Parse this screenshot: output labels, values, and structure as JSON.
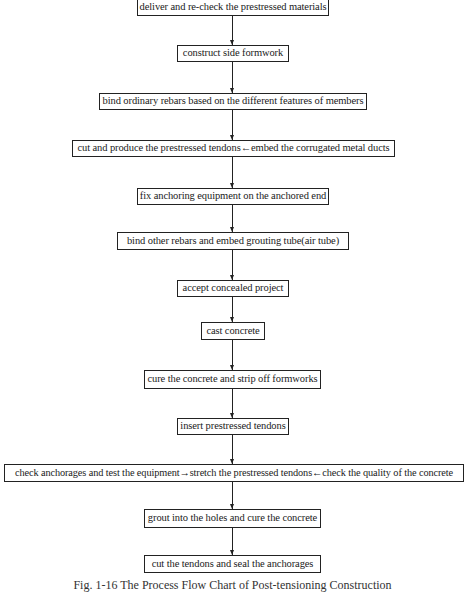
{
  "flowchart": {
    "steps": [
      {
        "id": 1,
        "label": "deliver and re-check the prestressed materials"
      },
      {
        "id": 2,
        "label": "construct side formwork"
      },
      {
        "id": 3,
        "label": "bind ordinary rebars based on the different features of members"
      },
      {
        "id": 4,
        "label": "cut and produce the prestressed tendons←embed the corrugated metal ducts"
      },
      {
        "id": 5,
        "label": "fix anchoring equipment on the anchored end"
      },
      {
        "id": 6,
        "label": "bind other rebars and embed grouting tube(air tube)"
      },
      {
        "id": 7,
        "label": "accept concealed project"
      },
      {
        "id": 8,
        "label": "cast concrete"
      },
      {
        "id": 9,
        "label": "cure the concrete and strip off formworks"
      },
      {
        "id": 10,
        "label": "insert prestressed tendons"
      },
      {
        "id": 11,
        "label": "check anchorages and test the equipment→stretch the prestressed tendons←check the quality of the concrete"
      },
      {
        "id": 12,
        "label": "grout into the holes and cure the concrete"
      },
      {
        "id": 13,
        "label": "cut the tendons and seal the anchorages"
      }
    ],
    "connections": [
      {
        "from": 1,
        "to": 2
      },
      {
        "from": 2,
        "to": 3
      },
      {
        "from": 3,
        "to": 4
      },
      {
        "from": 4,
        "to": 5
      },
      {
        "from": 5,
        "to": 6
      },
      {
        "from": 6,
        "to": 7
      },
      {
        "from": 7,
        "to": 8
      },
      {
        "from": 8,
        "to": 9
      },
      {
        "from": 9,
        "to": 10
      },
      {
        "from": 10,
        "to": 11
      },
      {
        "from": 11,
        "to": 12
      },
      {
        "from": 12,
        "to": 13
      }
    ]
  },
  "caption": "Fig. 1-16 The Process Flow Chart of Post-tensioning Construction"
}
